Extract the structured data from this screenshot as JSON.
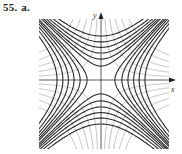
{
  "problem": {
    "number": "55.",
    "part": "a."
  },
  "chart_data": {
    "type": "line",
    "title": "",
    "xlabel": "x",
    "ylabel": "y",
    "xlim": [
      -3,
      3
    ],
    "ylim": [
      -3,
      3
    ],
    "grid": false,
    "legend": null,
    "series": [
      {
        "name": "x^2 - y^2 = c (dark)",
        "c_values": [
          -4,
          -3,
          -2.2,
          -1.5,
          -0.9,
          -0.4,
          0.4,
          0.9,
          1.5,
          2.2,
          3,
          4
        ],
        "color": "#222222"
      },
      {
        "name": "xy = k (light)",
        "k_values": [
          -3.5,
          -2.6,
          -1.8,
          -1.1,
          -0.5,
          0.5,
          1.1,
          1.8,
          2.6,
          3.5
        ],
        "color": "#bbbbbb"
      }
    ]
  },
  "colors": {
    "dark_curve": "#2a2a2a",
    "light_curve": "#c4c4c4",
    "axis": "#333333"
  }
}
